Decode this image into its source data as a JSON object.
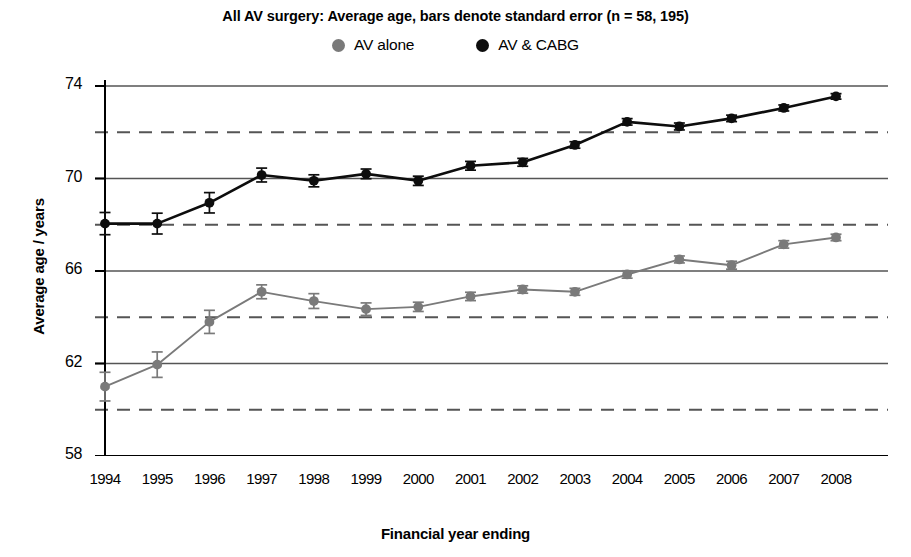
{
  "chart_data": {
    "type": "line",
    "title": "All AV surgery: Average age, bars denote standard error (n = 58, 195)",
    "xlabel": "Financial year ending",
    "ylabel": "Average age / years",
    "categories": [
      "1994",
      "1995",
      "1996",
      "1997",
      "1998",
      "1999",
      "2000",
      "2001",
      "2002",
      "2003",
      "2004",
      "2005",
      "2006",
      "2007",
      "2008"
    ],
    "x": [
      1994,
      1995,
      1996,
      1997,
      1998,
      1999,
      2000,
      2001,
      2002,
      2003,
      2004,
      2005,
      2006,
      2007,
      2008
    ],
    "ylim": [
      58,
      74
    ],
    "yticks": [
      58,
      62,
      66,
      70,
      74
    ],
    "y_gridlines_solid": [
      58,
      62,
      66,
      70,
      74
    ],
    "y_gridlines_dashed": [
      60,
      64,
      68,
      72
    ],
    "grid": true,
    "legend_position": "top-center",
    "series": [
      {
        "name": "AV alone",
        "color": "#7a7a7a",
        "marker": "circle",
        "values": [
          61.0,
          61.95,
          63.8,
          65.1,
          64.7,
          64.35,
          64.45,
          64.9,
          65.2,
          65.1,
          65.85,
          66.5,
          66.25,
          67.15,
          67.45
        ],
        "errors": [
          0.62,
          0.55,
          0.5,
          0.3,
          0.32,
          0.27,
          0.2,
          0.18,
          0.16,
          0.15,
          0.16,
          0.15,
          0.17,
          0.16,
          0.14
        ]
      },
      {
        "name": "AV & CABG",
        "color": "#0d0d0d",
        "marker": "circle",
        "values": [
          68.05,
          68.05,
          68.95,
          70.15,
          69.9,
          70.2,
          69.9,
          70.55,
          70.7,
          71.45,
          72.45,
          72.25,
          72.6,
          73.05,
          73.55
        ],
        "errors": [
          0.48,
          0.45,
          0.44,
          0.3,
          0.26,
          0.21,
          0.2,
          0.19,
          0.17,
          0.14,
          0.14,
          0.15,
          0.14,
          0.13,
          0.12
        ]
      }
    ]
  },
  "legend": {
    "items": [
      {
        "label": "AV alone",
        "color": "#7a7a7a"
      },
      {
        "label": "AV & CABG",
        "color": "#0d0d0d"
      }
    ]
  },
  "axes": {
    "y_title": "Average age / years",
    "x_title": "Financial year ending",
    "y_tick_labels": [
      "74",
      "70",
      "66",
      "62",
      "58"
    ],
    "x_tick_labels": [
      "1994",
      "1995",
      "1996",
      "1997",
      "1998",
      "1999",
      "2000",
      "2001",
      "2002",
      "2003",
      "2004",
      "2005",
      "2006",
      "2007",
      "2008"
    ]
  },
  "colors": {
    "axis": "#000000",
    "gridline_solid": "#555555",
    "gridline_dashed": "#555555",
    "series_grey": "#7a7a7a",
    "series_black": "#0d0d0d",
    "background": "#ffffff"
  }
}
